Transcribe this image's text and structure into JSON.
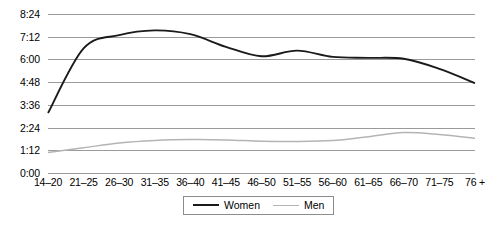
{
  "chart_data": {
    "type": "line",
    "title": "",
    "xlabel": "",
    "ylabel": "",
    "grid": true,
    "legend_position": "bottom-center",
    "categories": [
      "14–20",
      "21–25",
      "26–30",
      "31–35",
      "36–40",
      "41–45",
      "46–50",
      "51–55",
      "56–60",
      "61–65",
      "66–70",
      "71–75",
      "76 +"
    ],
    "y_ticks": [
      "0:00",
      "1:12",
      "2:24",
      "3:36",
      "4:48",
      "6:00",
      "7:12",
      "8:24"
    ],
    "y_tick_values": [
      0,
      72,
      144,
      216,
      288,
      360,
      432,
      504
    ],
    "ylim": [
      0,
      504
    ],
    "y_unit": "hours:minutes",
    "series": [
      {
        "name": "Women",
        "color": "#1a1a1a",
        "values": [
          190,
          395,
          437,
          452,
          440,
          400,
          370,
          388,
          368,
          365,
          362,
          330,
          285
        ],
        "labels": [
          "3:10",
          "6:35",
          "7:17",
          "7:32",
          "7:20",
          "6:40",
          "6:10",
          "6:28",
          "6:08",
          "6:05",
          "6:02",
          "5:30",
          "4:45"
        ]
      },
      {
        "name": "Men",
        "color": "#b4b4b4",
        "values": [
          65,
          80,
          95,
          103,
          106,
          105,
          101,
          100,
          103,
          115,
          128,
          122,
          110
        ],
        "labels": [
          "1:05",
          "1:20",
          "1:35",
          "1:43",
          "1:46",
          "1:45",
          "1:41",
          "1:40",
          "1:43",
          "1:55",
          "2:08",
          "2:02",
          "1:50"
        ]
      }
    ]
  },
  "legend": {
    "items": [
      {
        "label": "Women"
      },
      {
        "label": "Men"
      }
    ]
  }
}
